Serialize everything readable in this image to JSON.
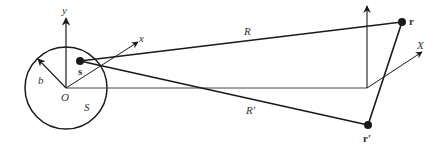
{
  "diagram": {
    "labels": {
      "y_axis": "y",
      "x_axis": "x",
      "origin": "O",
      "radius": "b",
      "source_point": "s",
      "region": "S",
      "distance_R": "R",
      "distance_R_prime": "R′",
      "field_point": "r",
      "field_point_prime": "r′",
      "far_X_axis": "X",
      "far_y_axis": "y"
    },
    "colors": {
      "stroke": "#1a1a1a",
      "axis": "#333333",
      "background": "#ffffff"
    }
  }
}
